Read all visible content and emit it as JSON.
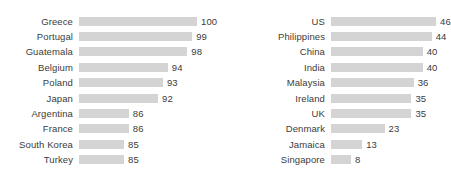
{
  "chart_data": {
    "type": "bar",
    "orientation": "horizontal",
    "title": "",
    "subtitle": "",
    "xlabel": "",
    "ylabel": "",
    "grid": false,
    "legend": null,
    "bar_color": "#d4d4d4",
    "label_color": "#3b3b3b",
    "background": "#ffffff",
    "panels": [
      {
        "name": "left-panel",
        "axis_min": 0,
        "axis_max": 100,
        "bar_px_per_unit": 4.87,
        "bar_px_at_min_value": 45,
        "categories": [
          "Greece",
          "Portugal",
          "Guatemala",
          "Belgium",
          "Poland",
          "Japan",
          "Argentina",
          "France",
          "South Korea",
          "Turkey"
        ],
        "values": [
          100,
          99,
          98,
          94,
          93,
          92,
          86,
          86,
          85,
          85
        ]
      },
      {
        "name": "right-panel",
        "axis_min": 0,
        "axis_max": 46,
        "bar_px_per_unit": 2.24,
        "bar_px_at_min_value": 20,
        "categories": [
          "US",
          "Philippines",
          "China",
          "India",
          "Malaysia",
          "Ireland",
          "UK",
          "Denmark",
          "Jamaica",
          "Singapore"
        ],
        "values": [
          46,
          44,
          40,
          40,
          36,
          35,
          35,
          23,
          13,
          8
        ]
      }
    ]
  }
}
